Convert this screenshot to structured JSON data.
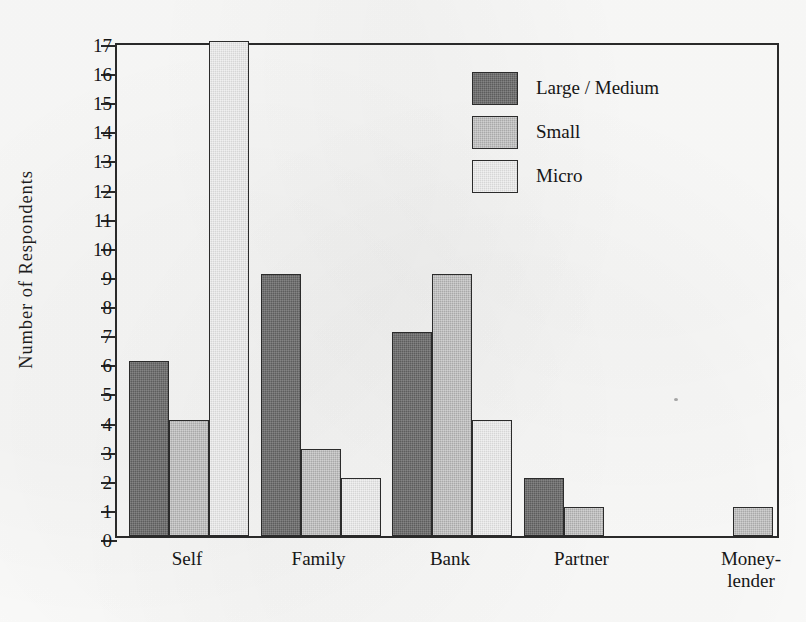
{
  "chart_data": {
    "type": "bar",
    "title": "",
    "xlabel": "",
    "ylabel": "Number of Respondents",
    "categories": [
      "Self",
      "Family",
      "Bank",
      "Partner",
      "Money-\nlender"
    ],
    "category_labels_plain": [
      "Self",
      "Family",
      "Bank",
      "Partner",
      "Money-lender"
    ],
    "series": [
      {
        "name": "Large / Medium",
        "color": "#5d5d5d",
        "values": [
          6,
          9,
          7,
          2,
          0
        ]
      },
      {
        "name": "Small",
        "color": "#a9a9a9",
        "values": [
          4,
          3,
          9,
          1,
          1
        ]
      },
      {
        "name": "Micro",
        "color": "#d6d6d6",
        "values": [
          17,
          2,
          4,
          0,
          0
        ]
      }
    ],
    "ylim": [
      0,
      17
    ],
    "y_ticks": [
      0,
      1,
      2,
      3,
      4,
      5,
      6,
      7,
      8,
      9,
      10,
      11,
      12,
      13,
      14,
      15,
      16,
      17
    ],
    "y_tick_labels": [
      "0",
      "1",
      "2",
      "3",
      "4",
      "5",
      "6",
      "7",
      "8",
      "9",
      "10",
      "11",
      "12",
      "13",
      "14",
      "15",
      "16",
      "17"
    ],
    "grid": false,
    "legend_position": "upper-right-inside"
  },
  "axis": {
    "y_title": "Number of Respondents"
  },
  "legend": {
    "entries": [
      {
        "label": "Large / Medium",
        "swatch": "dark-gray-swatch"
      },
      {
        "label": "Small",
        "swatch": "medium-gray-swatch"
      },
      {
        "label": "Micro",
        "swatch": "light-gray-swatch"
      }
    ]
  },
  "colors": {
    "series_large_medium": "#5d5d5d",
    "series_small": "#a9a9a9",
    "series_micro": "#d6d6d6",
    "axis_line": "#2a2a2a",
    "text": "#161616",
    "background": "#fbfbfa"
  }
}
